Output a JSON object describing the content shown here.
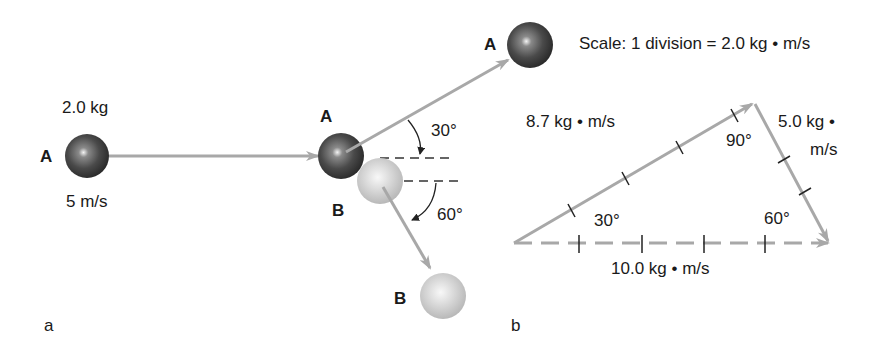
{
  "panel_a": {
    "label": "a",
    "before": {
      "ball_label": "A",
      "mass": "2.0 kg",
      "speed": "5 m/s"
    },
    "collision": {
      "ball_a_label": "A",
      "ball_b_label": "B",
      "angle_a": "30°",
      "angle_b": "60°"
    },
    "after": {
      "ball_a_label": "A",
      "ball_b_label": "B"
    }
  },
  "panel_b": {
    "label": "b",
    "scale": "Scale: 1 division = 2.0 kg • m/s",
    "vector_a": "8.7 kg • m/s",
    "vector_b_line1": "5.0 kg •",
    "vector_b_line2": "m/s",
    "vector_total": "10.0 kg • m/s",
    "angle_left": "30°",
    "angle_top": "90°",
    "angle_right": "60°"
  },
  "colors": {
    "ball_dark": "#3a3a3a",
    "ball_light": "#cfcfcf",
    "vector": "#a8a8a8",
    "text": "#1a1a1a"
  }
}
